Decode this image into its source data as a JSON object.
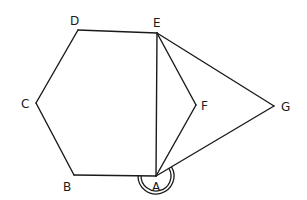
{
  "figure": {
    "type": "geometry-diagram",
    "stroke_color": "#1a1a1a",
    "background": "#ffffff"
  },
  "vertices": [
    {
      "id": "A",
      "label": "A",
      "x": 156,
      "y": 176,
      "label_x": 152,
      "label_y": 191
    },
    {
      "id": "B",
      "label": "B",
      "x": 74,
      "y": 175,
      "label_x": 63,
      "label_y": 191
    },
    {
      "id": "C",
      "label": "C",
      "x": 36,
      "y": 103,
      "label_x": 21,
      "label_y": 108
    },
    {
      "id": "D",
      "label": "D",
      "x": 78,
      "y": 30,
      "label_x": 70,
      "label_y": 25
    },
    {
      "id": "E",
      "label": "E",
      "x": 157,
      "y": 33,
      "label_x": 153,
      "label_y": 27
    },
    {
      "id": "F",
      "label": "F",
      "x": 196,
      "y": 105,
      "label_x": 201,
      "label_y": 110
    },
    {
      "id": "G",
      "label": "G",
      "x": 274,
      "y": 106,
      "label_x": 281,
      "label_y": 111
    }
  ],
  "edges": [
    [
      "A",
      "B"
    ],
    [
      "B",
      "C"
    ],
    [
      "C",
      "D"
    ],
    [
      "D",
      "E"
    ],
    [
      "E",
      "A"
    ],
    [
      "E",
      "F"
    ],
    [
      "F",
      "A"
    ],
    [
      "E",
      "G"
    ],
    [
      "G",
      "A"
    ]
  ],
  "angle_markers": [
    {
      "vertex": "A",
      "style": "double-arc",
      "description": "reflex angle at A (between AB and AG, measured below)",
      "from_vertex": "G",
      "to_vertex": "B",
      "radii": [
        15,
        18
      ]
    }
  ]
}
